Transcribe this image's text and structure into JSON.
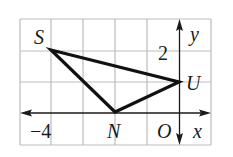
{
  "diagram": {
    "type": "coordinate-plane-triangle",
    "grid": {
      "x_min": -5,
      "x_max": 1,
      "y_min": -1,
      "y_max": 4,
      "spacing": 1
    },
    "axes": {
      "x_label": "x",
      "y_label": "y",
      "origin_label": "O",
      "tick_labels": [
        {
          "axis": "x",
          "value": -4,
          "text": "−4"
        },
        {
          "axis": "y",
          "value": 2,
          "text": "2"
        }
      ]
    },
    "points": [
      {
        "name": "S",
        "x": -4,
        "y": 3
      },
      {
        "name": "U",
        "x": 0,
        "y": 1
      },
      {
        "name": "N",
        "x": -2,
        "y": 0
      }
    ],
    "polygon": [
      "S",
      "U",
      "N"
    ],
    "colors": {
      "grid": "#bdbdbd",
      "axis": "#1a1a1a",
      "triangle": "#111111"
    }
  }
}
